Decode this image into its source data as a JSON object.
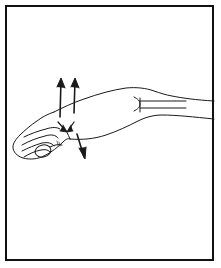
{
  "figure": {
    "description": "Line drawing of a right forearm and hand seen from the side, with the hand relaxed and fingers gently curled. Straight directional arrows are drawn across the forearm just behind the wrist.",
    "border_color": "#111111",
    "background_color": "#ffffff",
    "line_color": "#1a1a1a",
    "annotations": [
      {
        "name": "up-arrow-left",
        "direction": "up",
        "label": ""
      },
      {
        "name": "up-arrow-right",
        "direction": "up",
        "label": ""
      },
      {
        "name": "down-arrow-wrist-left",
        "direction": "down",
        "label": ""
      },
      {
        "name": "down-arrow-wrist-right",
        "direction": "down",
        "label": ""
      },
      {
        "name": "down-arrow-lower",
        "direction": "down",
        "label": ""
      }
    ],
    "body_parts": [
      "forearm",
      "wrist",
      "hand",
      "thumb",
      "index-finger",
      "middle-finger",
      "ring-finger",
      "little-finger",
      "elbow-marking"
    ]
  }
}
